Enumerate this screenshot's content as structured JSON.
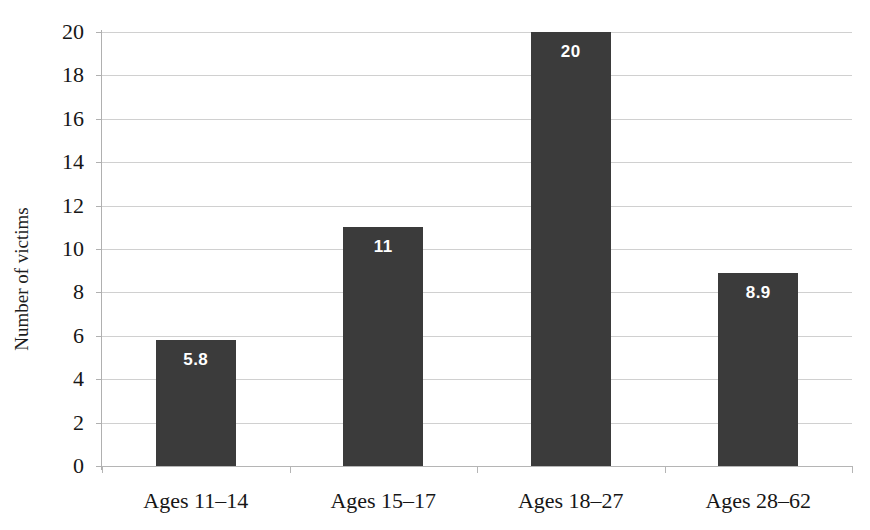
{
  "figure": {
    "title_fragment": "cropped caption text (illegible, clipped at top edge)",
    "background_color": "#ffffff",
    "bar_color": "#3b3b3b",
    "gridline_color": "#d0d0d0",
    "axis_color": "#b5b5b5",
    "value_label_color": "#ffffff"
  },
  "chart_data": {
    "type": "bar",
    "title": "",
    "xlabel": "",
    "ylabel": "Number of victims",
    "categories": [
      "Ages 11–14",
      "Ages 15–17",
      "Ages 18–27",
      "Ages 28–62"
    ],
    "values": [
      5.8,
      11,
      20,
      8.9
    ],
    "value_labels": [
      "5.8",
      "11",
      "20",
      "8.9"
    ],
    "ylim": [
      0,
      20
    ],
    "ytick_step": 2,
    "yticks": [
      20,
      18,
      16,
      14,
      12,
      10,
      8,
      6,
      4,
      2,
      0
    ],
    "ytick_labels": [
      "20",
      "18",
      "16",
      "14",
      "12",
      "10",
      "8",
      "6",
      "4",
      "2",
      "0"
    ],
    "grid": true,
    "grid_axis": "y",
    "legend": false,
    "legend_position": "none",
    "series": [
      {
        "name": "Number of victims",
        "values": [
          5.8,
          11,
          20,
          8.9
        ],
        "color": "#3b3b3b"
      }
    ]
  }
}
